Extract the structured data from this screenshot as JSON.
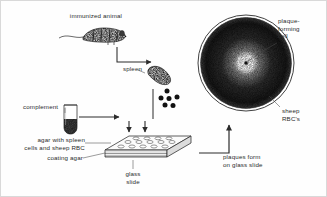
{
  "figure": {
    "labels": {
      "immunized_animal": "immunized animal",
      "spleen": "spleen",
      "complement": "complement",
      "agar_with_spleen_cells": "agar with spleen\ncells and sheep RBC",
      "coating_agar": "coating agar",
      "glass_slide": "glass\nslide",
      "plaques_form": "plaques form\non glass slide",
      "plaque_forming_cell": "plaque-\nforming\ncell",
      "sheep_rbcs": "sheep\nRBC's"
    },
    "elements": {
      "mouse": "immunized mouse with tail",
      "spleen_organ": "stippled kidney-bean spleen",
      "spleen_cell_count": 6,
      "test_tube": "test tube with dark sediment",
      "slide_spot_rows": [
        5,
        5,
        4
      ],
      "petri_plaque_center_cell": 1
    },
    "colors": {
      "ink": "#2b2b2b",
      "stipple": "#1d1d1d",
      "background": "#fefefe",
      "frame": "#d9d9d9",
      "tube_fill": "#ffffff",
      "slab_face": "#f2f2f2"
    }
  }
}
